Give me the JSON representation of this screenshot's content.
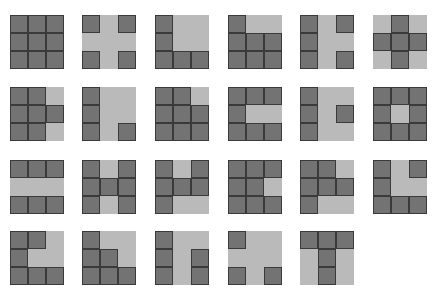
{
  "colors": {
    "dark": "#737373",
    "light": "#bababa",
    "border": "#3a3a3a"
  },
  "layout": {
    "cols_x": [
      10,
      82,
      155,
      228,
      300,
      373
    ],
    "rows_y": [
      15,
      87,
      160,
      231
    ],
    "cell": 18
  },
  "patterns": [
    [
      "111",
      "111",
      "111"
    ],
    [
      "101",
      "000",
      "101"
    ],
    [
      "100",
      "100",
      "111"
    ],
    [
      "100",
      "111",
      "111"
    ],
    [
      "101",
      "100",
      "101"
    ],
    [
      "010",
      "111",
      "010"
    ],
    [
      "110",
      "111",
      "110"
    ],
    [
      "100",
      "100",
      "101"
    ],
    [
      "110",
      "111",
      "111"
    ],
    [
      "111",
      "100",
      "111"
    ],
    [
      "100",
      "101",
      "100"
    ],
    [
      "111",
      "101",
      "111"
    ],
    [
      "111",
      "000",
      "111"
    ],
    [
      "101",
      "111",
      "101"
    ],
    [
      "101",
      "111",
      "100"
    ],
    [
      "111",
      "110",
      "111"
    ],
    [
      "110",
      "111",
      "100"
    ],
    [
      "101",
      "100",
      "111"
    ],
    [
      "110",
      "100",
      "111"
    ],
    [
      "100",
      "110",
      "111"
    ],
    [
      "100",
      "101",
      "101"
    ],
    [
      "100",
      "000",
      "101"
    ],
    [
      "111",
      "010",
      "010"
    ]
  ]
}
